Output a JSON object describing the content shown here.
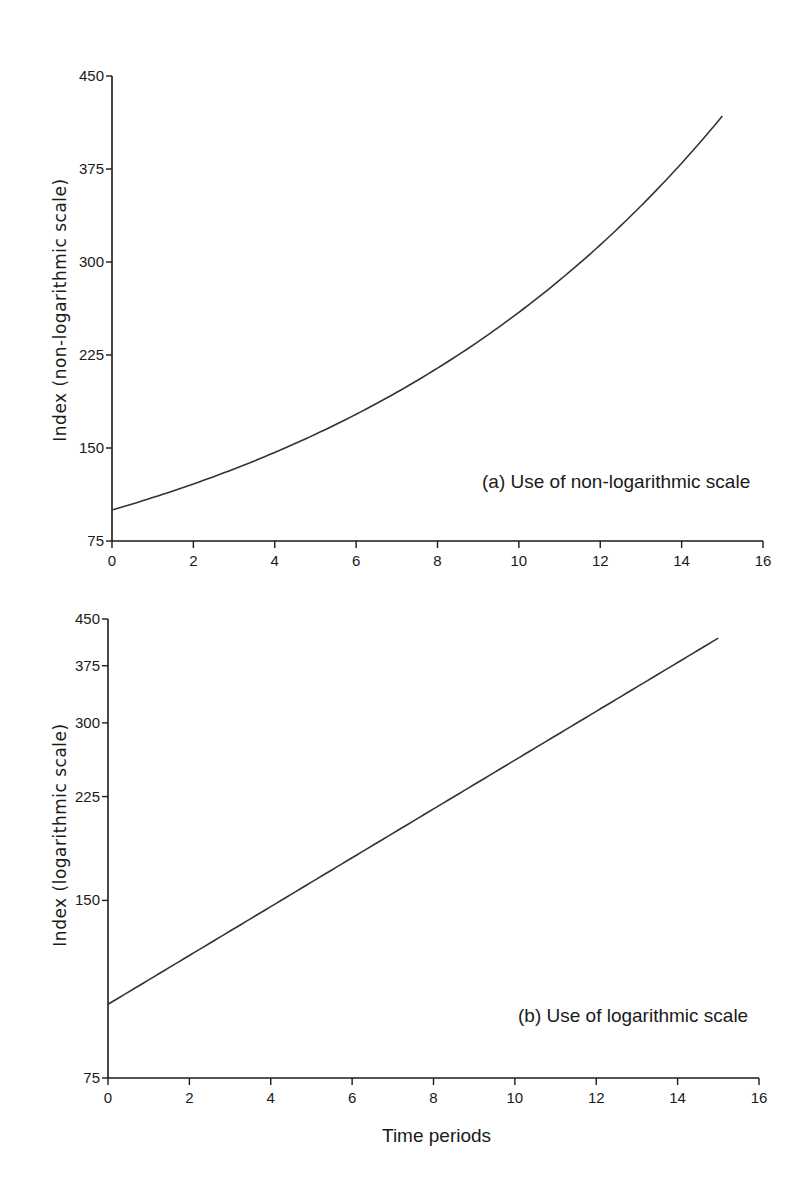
{
  "colors": {
    "line": "#333333",
    "axis": "#1a1a1a",
    "background": "#ffffff"
  },
  "chart_data": [
    {
      "type": "line",
      "id": "a",
      "title": "(a) Use of non-logarithmic scale",
      "xlabel": "",
      "ylabel": "Index (non-logarithmic scale)",
      "yscale": "linear",
      "xlim": [
        0,
        16
      ],
      "ylim": [
        75,
        450
      ],
      "xticks": [
        0,
        2,
        4,
        6,
        8,
        10,
        12,
        14,
        16
      ],
      "yticks": [
        75,
        150,
        225,
        300,
        375,
        450
      ],
      "grid": false,
      "x": [
        0,
        1,
        2,
        3,
        4,
        5,
        6,
        7,
        8,
        9,
        10,
        11,
        12,
        13,
        14,
        15
      ],
      "series": [
        {
          "name": "Index",
          "values": [
            100,
            110,
            121,
            133.1,
            146.4,
            161.1,
            177.2,
            194.9,
            214.4,
            235.8,
            259.4,
            285.3,
            313.8,
            345.2,
            379.7,
            417.7
          ]
        }
      ]
    },
    {
      "type": "line",
      "id": "b",
      "title": "(b) Use of logarithmic scale",
      "xlabel": "Time periods",
      "ylabel": "Index (logarithmic scale)",
      "yscale": "log",
      "xlim": [
        0,
        16
      ],
      "ylim": [
        75,
        450
      ],
      "xticks": [
        0,
        2,
        4,
        6,
        8,
        10,
        12,
        14,
        16
      ],
      "yticks": [
        75,
        150,
        225,
        300,
        375,
        450
      ],
      "grid": false,
      "x": [
        0,
        1,
        2,
        3,
        4,
        5,
        6,
        7,
        8,
        9,
        10,
        11,
        12,
        13,
        14,
        15
      ],
      "series": [
        {
          "name": "Index",
          "values": [
            100,
            110,
            121,
            133.1,
            146.4,
            161.1,
            177.2,
            194.9,
            214.4,
            235.8,
            259.4,
            285.3,
            313.8,
            345.2,
            379.7,
            417.7
          ]
        }
      ]
    }
  ]
}
